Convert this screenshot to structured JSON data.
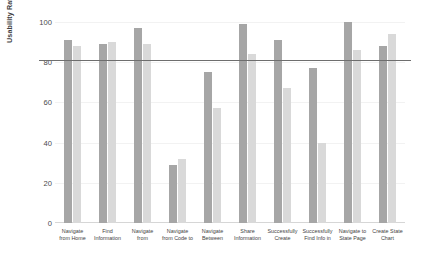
{
  "chart_data": {
    "type": "bar",
    "title": "",
    "xlabel": "",
    "ylabel": "Usability Rating",
    "ylim": [
      0,
      100
    ],
    "yticks": [
      0,
      20,
      40,
      60,
      80,
      100
    ],
    "grid": true,
    "legend": "none",
    "threshold_line": {
      "value": 81,
      "label": ""
    },
    "categories": [
      "Navigate from Home",
      "Find Information",
      "Navigate from",
      "Navigate from Code to",
      "Navigate Between",
      "Share Information",
      "Successfully Create",
      "Successfully Find Info in",
      "Navigate to State Page",
      "Create State Chart"
    ],
    "series": [
      {
        "name": "series-1",
        "color": "#a6a6a6",
        "values": [
          91,
          89,
          97,
          29,
          75,
          99,
          91,
          77,
          100,
          88
        ]
      },
      {
        "name": "series-2",
        "color": "#d9d9d9",
        "values": [
          88,
          90,
          89,
          32,
          57,
          84,
          67,
          40,
          86,
          94
        ]
      }
    ]
  },
  "axis": {
    "y_title": "Usability Rating",
    "y_tick_labels": [
      "0",
      "20",
      "40",
      "60",
      "80",
      "100"
    ]
  }
}
